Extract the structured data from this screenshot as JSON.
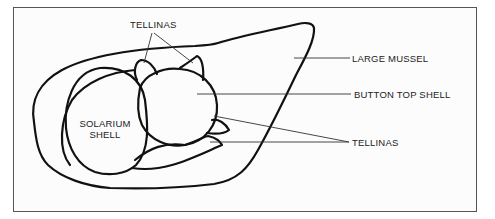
{
  "diagram": {
    "type": "labeled-illustration",
    "colors": {
      "outline": "#111111",
      "leader": "#333333",
      "frame": "#555555",
      "background": "#fcfcfc"
    },
    "labels": {
      "tellinas_top": "TELLINAS",
      "large_mussel": "LARGE MUSSEL",
      "button_top_shell": "BUTTON TOP SHELL",
      "tellinas_bottom": "TELLINAS",
      "solarium_line1": "SOLARIUM",
      "solarium_line2": "SHELL"
    },
    "parts": [
      {
        "id": "large-mussel",
        "label": "LARGE MUSSEL"
      },
      {
        "id": "button-top-shell",
        "label": "BUTTON TOP SHELL"
      },
      {
        "id": "solarium-shell",
        "label": "SOLARIUM SHELL"
      },
      {
        "id": "tellinas-top",
        "label": "TELLINAS",
        "count": 2
      },
      {
        "id": "tellinas-bottom",
        "label": "TELLINAS",
        "count": 2
      }
    ]
  }
}
